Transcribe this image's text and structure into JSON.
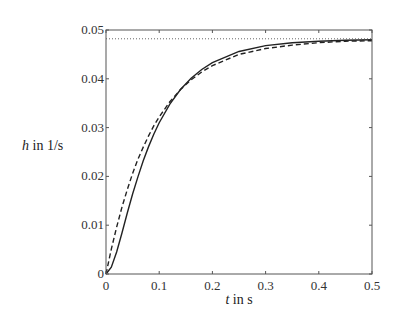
{
  "chart_data": {
    "type": "line",
    "title": "",
    "xlabel_var": "t",
    "xlabel_unit": " in s",
    "ylabel_var": "h",
    "ylabel_unit": " in 1/s",
    "xlim": [
      0,
      0.5
    ],
    "ylim": [
      0,
      0.05
    ],
    "xticks": [
      0,
      0.1,
      0.2,
      0.3,
      0.4,
      0.5
    ],
    "xtick_labels": [
      "0",
      "0.1",
      "0.2",
      "0.3",
      "0.4",
      "0.5"
    ],
    "yticks": [
      0,
      0.01,
      0.02,
      0.03,
      0.04,
      0.05
    ],
    "ytick_labels": [
      "0",
      "0.01",
      "0.02",
      "0.03",
      "0.04",
      "0.05"
    ],
    "grid": false,
    "legend": null,
    "series": [
      {
        "name": "solid (second-order response)",
        "style": "solid",
        "color": "#222222",
        "x": [
          0,
          0.01,
          0.02,
          0.03,
          0.04,
          0.05,
          0.06,
          0.07,
          0.08,
          0.09,
          0.1,
          0.12,
          0.14,
          0.16,
          0.18,
          0.2,
          0.25,
          0.3,
          0.35,
          0.4,
          0.45,
          0.5
        ],
        "y": [
          0,
          0.0014,
          0.0045,
          0.0084,
          0.0125,
          0.0164,
          0.0199,
          0.0232,
          0.0261,
          0.0287,
          0.031,
          0.0348,
          0.0378,
          0.0401,
          0.0419,
          0.0433,
          0.0456,
          0.0468,
          0.0474,
          0.0477,
          0.0479,
          0.048
        ]
      },
      {
        "name": "dashed (first-order response)",
        "style": "dashed",
        "color": "#222222",
        "x": [
          0,
          0.01,
          0.02,
          0.03,
          0.04,
          0.05,
          0.06,
          0.07,
          0.08,
          0.09,
          0.1,
          0.12,
          0.14,
          0.16,
          0.18,
          0.2,
          0.25,
          0.3,
          0.35,
          0.4,
          0.45,
          0.5
        ],
        "y": [
          0,
          0.0051,
          0.0096,
          0.0137,
          0.0173,
          0.0206,
          0.0235,
          0.026,
          0.0283,
          0.0304,
          0.0322,
          0.0353,
          0.0378,
          0.0398,
          0.0414,
          0.0427,
          0.045,
          0.0462,
          0.0469,
          0.0474,
          0.0477,
          0.0478
        ]
      },
      {
        "name": "dotted (steady-state asymptote)",
        "style": "dotted",
        "color": "#666666",
        "x": [
          0,
          0.5
        ],
        "y": [
          0.0482,
          0.0482
        ]
      }
    ],
    "annotations": []
  }
}
